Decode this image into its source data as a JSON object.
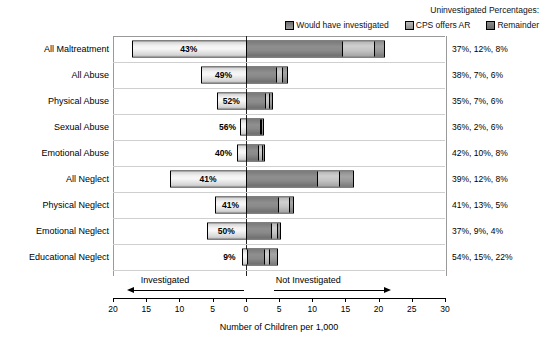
{
  "legend": {
    "title": "Uninvestigated Percentages:",
    "items": [
      {
        "label": "Would have investigated",
        "swatch": "legend-swatch-would-have-investigated",
        "color": "#8a8a8a"
      },
      {
        "label": "CPS offers AR",
        "swatch": "legend-swatch-cps-offers-ar",
        "color": "#c2c2c2"
      },
      {
        "label": "Remainder",
        "swatch": "legend-swatch-remainder",
        "color": "#9a9a9a"
      }
    ]
  },
  "annotations": {
    "left_label": "Investigated",
    "right_label": "Not Investigated"
  },
  "axis": {
    "title": "Number of Children per 1,000",
    "ticks": [
      "20",
      "15",
      "10",
      "5",
      "0",
      "5",
      "10",
      "15",
      "20",
      "25",
      "30"
    ]
  },
  "chart_data": {
    "type": "bar",
    "orientation": "horizontal-diverging-stacked",
    "title": "",
    "xlabel": "Number of Children per 1,000",
    "ylabel": "",
    "xlim": [
      -20,
      30
    ],
    "grid": true,
    "legend_position": "top-right",
    "left_axis_label": "Investigated",
    "right_axis_label": "Not Investigated",
    "categories": [
      "All Maltreatment",
      "All Abuse",
      "Physical Abuse",
      "Sexual Abuse",
      "Emotional Abuse",
      "All Neglect",
      "Physical Neglect",
      "Emotional Neglect",
      "Educational Neglect"
    ],
    "series": [
      {
        "name": "Investigated",
        "side": "left",
        "values": [
          17.2,
          6.7,
          4.4,
          0.8,
          1.4,
          11.4,
          4.6,
          5.9,
          0.5
        ]
      },
      {
        "name": "Would have investigated",
        "side": "right",
        "values": [
          14.6,
          4.7,
          3.0,
          2.3,
          2.0,
          10.8,
          5.0,
          3.9,
          2.8
        ]
      },
      {
        "name": "CPS offers AR",
        "side": "right",
        "values": [
          4.8,
          0.9,
          0.6,
          0.1,
          0.5,
          3.3,
          1.6,
          1.0,
          0.8
        ]
      },
      {
        "name": "Remainder",
        "side": "right",
        "values": [
          1.6,
          0.7,
          0.5,
          0.4,
          0.4,
          2.2,
          0.6,
          0.4,
          1.2
        ]
      }
    ],
    "bar_labels": [
      "43%",
      "49%",
      "52%",
      "56%",
      "40%",
      "41%",
      "41%",
      "50%",
      "9%"
    ],
    "row_annotations": [
      "37%, 12%, 8%",
      "38%, 7%, 6%",
      "35%, 7%, 6%",
      "36%, 2%, 6%",
      "42%, 10%, 8%",
      "39%, 12%, 8%",
      "41%, 13%, 5%",
      "37%, 9%, 4%",
      "54%, 15%, 22%"
    ]
  }
}
